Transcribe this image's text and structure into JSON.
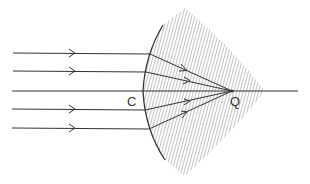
{
  "figure": {
    "labels": {
      "center": "C",
      "focus": "Q"
    },
    "colors": {
      "line": "#333333",
      "hatch": "#666666",
      "background": "#ffffff"
    },
    "rays": {
      "count": 5,
      "y_positions": [
        53,
        71,
        91,
        109,
        128
      ],
      "arrow_on_axis": false
    },
    "axis": {
      "y": 91,
      "x_start": 12,
      "x_end": 298
    },
    "focal_point": {
      "x": 232,
      "y": 91
    }
  }
}
